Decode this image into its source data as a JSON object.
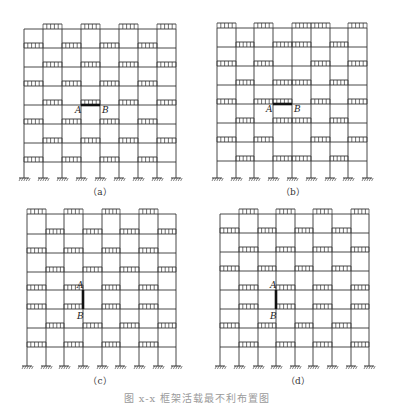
{
  "figure": {
    "caption": "图 x-x   框架活载最不利布置图",
    "line_color": "#333333",
    "highlight_color": "#111111",
    "ground_count": 9,
    "panels": [
      {
        "id": "a",
        "label": "（a）",
        "label_pos": [
          100,
          195
        ],
        "columns_x": [
          24,
          43,
          62,
          81,
          100,
          119,
          138,
          157,
          176
        ],
        "floors_y": [
          29,
          48,
          67,
          86,
          105,
          124,
          143,
          162
        ],
        "ground_y": 178,
        "loads": [
          [
            1,
            3,
            5,
            7
          ],
          [
            0,
            2,
            4,
            6
          ],
          [
            1,
            3,
            5,
            7
          ],
          [
            0,
            2,
            4,
            6
          ],
          [
            1,
            3,
            5,
            7
          ],
          [
            0,
            2,
            4,
            6
          ],
          [
            1,
            3,
            5,
            7
          ],
          [
            0,
            2,
            4,
            6
          ]
        ],
        "highlight": {
          "type": "beam",
          "floor": 4,
          "bay": 3
        },
        "label_A": {
          "text": "A",
          "x": 75,
          "y": 113
        },
        "label_B": {
          "text": "B",
          "x": 102,
          "y": 113
        }
      },
      {
        "id": "b",
        "label": "（b）",
        "label_pos": [
          293,
          195
        ],
        "columns_x": [
          217,
          236,
          254,
          273,
          292,
          311,
          330,
          348,
          367
        ],
        "floors_y": [
          28,
          47,
          66,
          85,
          104,
          123,
          142,
          161
        ],
        "ground_y": 178,
        "loads": [
          [
            0,
            2,
            4,
            5,
            7
          ],
          [
            1,
            3,
            4,
            6
          ],
          [
            0,
            2,
            5,
            7
          ],
          [
            1,
            3,
            4,
            6
          ],
          [
            0,
            2,
            3,
            5,
            7
          ],
          [
            1,
            3,
            4,
            6
          ],
          [
            0,
            2,
            5,
            7
          ],
          [
            1,
            3,
            4,
            6
          ]
        ],
        "highlight": {
          "type": "beam",
          "floor": 4,
          "bay": 3
        },
        "label_A": {
          "text": "A",
          "x": 266,
          "y": 112
        },
        "label_B": {
          "text": "B",
          "x": 294,
          "y": 112
        }
      },
      {
        "id": "c",
        "label": "（c）",
        "label_pos": [
          100,
          384
        ],
        "columns_x": [
          27,
          46,
          64,
          83,
          102,
          120,
          139,
          158,
          176
        ],
        "floors_y": [
          214,
          234,
          253,
          272,
          290,
          309,
          328,
          347
        ],
        "ground_y": 366,
        "loads": [
          [
            0,
            2,
            4,
            6
          ],
          [
            1,
            3,
            5,
            7
          ],
          [
            0,
            2,
            4,
            6
          ],
          [
            1,
            3,
            5,
            7
          ],
          [
            0,
            2,
            4,
            6
          ],
          [
            0,
            2,
            4,
            6
          ],
          [
            1,
            3,
            5,
            7
          ],
          [
            0,
            2,
            4,
            6
          ]
        ],
        "highlight": {
          "type": "column",
          "col": 3,
          "from_floor": 4,
          "to_floor": 5
        },
        "label_A": {
          "text": "A",
          "x": 77,
          "y": 288
        },
        "label_B": {
          "text": "B",
          "x": 77,
          "y": 319
        }
      },
      {
        "id": "d",
        "label": "（d）",
        "label_pos": [
          298,
          384
        ],
        "columns_x": [
          220,
          239,
          258,
          276,
          295,
          313,
          332,
          351,
          369
        ],
        "floors_y": [
          214,
          233,
          252,
          271,
          290,
          309,
          328,
          347
        ],
        "ground_y": 366,
        "loads": [
          [
            1,
            3,
            5,
            7
          ],
          [
            0,
            2,
            4,
            6
          ],
          [
            1,
            3,
            5,
            7
          ],
          [
            0,
            2,
            4,
            6
          ],
          [
            1,
            3,
            5,
            7
          ],
          [
            1,
            3,
            5,
            7
          ],
          [
            0,
            2,
            4,
            6
          ],
          [
            1,
            3,
            5,
            7
          ]
        ],
        "highlight": {
          "type": "column",
          "col": 3,
          "from_floor": 4,
          "to_floor": 5
        },
        "label_A": {
          "text": "A",
          "x": 270,
          "y": 288
        },
        "label_B": {
          "text": "B",
          "x": 270,
          "y": 319
        }
      }
    ]
  }
}
